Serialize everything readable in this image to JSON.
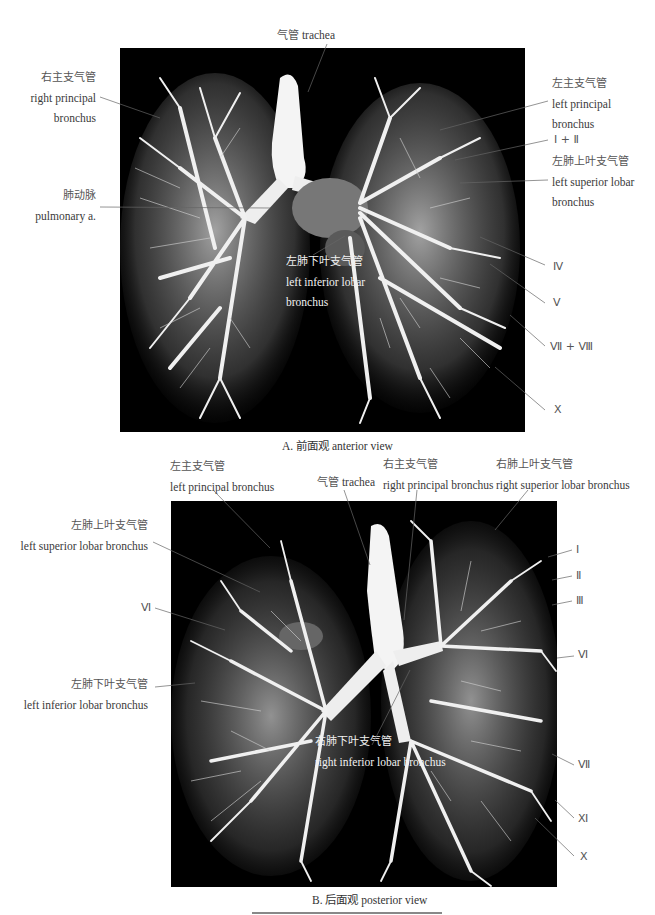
{
  "figure_a": {
    "caption": "A. 前面观 anterior view",
    "labels": {
      "trachea": {
        "zh": "气管",
        "en": "trachea"
      },
      "right_principal_bronchus": {
        "zh": "右主支气管",
        "en1": "right principal",
        "en2": "bronchus"
      },
      "pulmonary_artery": {
        "zh": "肺动脉",
        "en": "pulmonary a."
      },
      "left_principal_bronchus": {
        "zh": "左主支气管",
        "en1": "left principal",
        "en2": "bronchus"
      },
      "segment_1_2": "Ⅰ + Ⅱ",
      "left_superior_lobar_bronchus": {
        "zh": "左肺上叶支气管",
        "en1": "left superior lobar",
        "en2": "bronchus"
      },
      "left_inferior_lobar_bronchus": {
        "zh": "左肺下叶支气管",
        "en1": "left inferior lobar",
        "en2": "bronchus"
      },
      "segment_4": "Ⅳ",
      "segment_5": "Ⅴ",
      "segment_7_8": "Ⅶ + Ⅷ",
      "segment_10": "Ⅹ"
    }
  },
  "figure_b": {
    "caption": "B. 后面观 posterior view",
    "labels": {
      "left_principal_bronchus": {
        "zh": "左主支气管",
        "en": "left principal bronchus"
      },
      "trachea": {
        "zh": "气管",
        "en": "trachea"
      },
      "right_principal_bronchus": {
        "zh": "右主支气管",
        "en": "right principal bronchus"
      },
      "right_superior_lobar_bronchus": {
        "zh": "右肺上叶支气管",
        "en": "right superior lobar bronchus"
      },
      "left_superior_lobar_bronchus": {
        "zh": "左肺上叶支气管",
        "en": "left superior lobar bronchus"
      },
      "segment_6_left": "Ⅵ",
      "left_inferior_lobar_bronchus": {
        "zh": "左肺下叶支气管",
        "en": "left inferior lobar bronchus"
      },
      "right_inferior_lobar_bronchus": {
        "zh": "右肺下叶支气管",
        "en": "right inferior lobar bronchus"
      },
      "segment_1": "Ⅰ",
      "segment_2": "Ⅱ",
      "segment_3": "Ⅲ",
      "segment_6_right": "Ⅵ",
      "segment_7": "Ⅶ",
      "segment_11": "Ⅺ",
      "segment_10": "Ⅹ"
    }
  },
  "colors": {
    "panel_bg": "#000000",
    "cast": "#eeeeee",
    "leader": "#666666"
  }
}
